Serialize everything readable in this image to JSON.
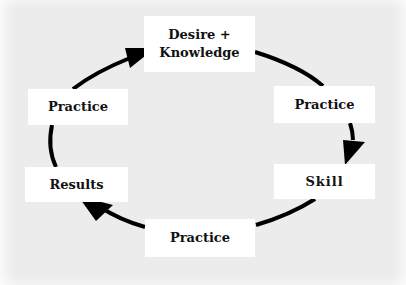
{
  "diagram": {
    "type": "cycle",
    "nodes": [
      {
        "id": "desire",
        "label": "Desire + Knowledge",
        "line1": "Desire +",
        "line2": "Knowledge"
      },
      {
        "id": "practice_right",
        "label": "Practice"
      },
      {
        "id": "skill",
        "label": "Skill"
      },
      {
        "id": "practice_bottom",
        "label": "Practice"
      },
      {
        "id": "results",
        "label": "Results"
      },
      {
        "id": "practice_left",
        "label": "Practice"
      }
    ],
    "edges": [
      {
        "from": "desire",
        "to": "practice_right"
      },
      {
        "from": "practice_right",
        "to": "skill",
        "arrow": true
      },
      {
        "from": "skill",
        "to": "practice_bottom"
      },
      {
        "from": "practice_bottom",
        "to": "results",
        "arrow": true
      },
      {
        "from": "results",
        "to": "practice_left"
      },
      {
        "from": "practice_left",
        "to": "desire",
        "arrow": true
      }
    ],
    "colors": {
      "background": "#ececec",
      "box": "#ffffff",
      "line": "#000000",
      "text": "#111111"
    }
  }
}
